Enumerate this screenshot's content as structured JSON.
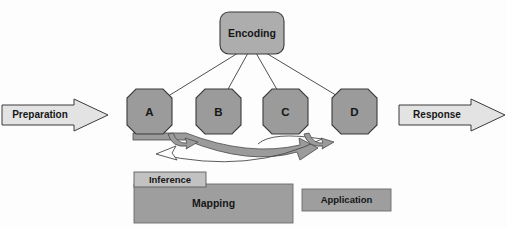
{
  "diagram": {
    "canvas": {
      "width": 507,
      "height": 229,
      "background": "#fdfdfd"
    },
    "colors": {
      "node_fill": "#9b9b9b",
      "node_stroke": "#3b3b3b",
      "encoding_fill": "#adadad",
      "band_fill": "#9e9e9e",
      "band_light_fill": "#c2c2c2",
      "arrow_fill": "#e3e3e3",
      "curve_fill": "#9b9b9b",
      "text": "#161616",
      "line": "#3b3b3b"
    },
    "encoding": {
      "label": "Encoding",
      "shape": "rounded-rectangle",
      "x": 220,
      "y": 12,
      "width": 64,
      "height": 42,
      "radius": 9
    },
    "nodes": [
      {
        "id": "a",
        "label": "A",
        "shape": "octagon",
        "cx": 149.5,
        "cy": 111.5,
        "r": 23
      },
      {
        "id": "b",
        "label": "B",
        "shape": "octagon",
        "cx": 218.5,
        "cy": 111.5,
        "r": 23
      },
      {
        "id": "c",
        "label": "C",
        "shape": "octagon",
        "cx": 285.5,
        "cy": 111.5,
        "r": 23
      },
      {
        "id": "d",
        "label": "D",
        "shape": "octagon",
        "cx": 354.5,
        "cy": 111.5,
        "r": 23
      }
    ],
    "flow_arrows": [
      {
        "id": "preparation",
        "label": "Preparation",
        "direction": "right",
        "x": 2,
        "y": 99,
        "width": 106,
        "height": 32
      },
      {
        "id": "response",
        "label": "Response",
        "direction": "right",
        "x": 399,
        "y": 99,
        "width": 106,
        "height": 32
      }
    ],
    "bands": [
      {
        "id": "inference",
        "label": "Inference",
        "x": 134,
        "y": 172,
        "width": 72,
        "height": 15,
        "fill": "light"
      },
      {
        "id": "mapping",
        "label": "Mapping",
        "x": 134,
        "y": 184,
        "width": 159,
        "height": 39,
        "fill": "dark"
      },
      {
        "id": "application",
        "label": "Application",
        "x": 302,
        "y": 189,
        "width": 89,
        "height": 22,
        "fill": "dark"
      }
    ],
    "connectors": [
      {
        "from": "encoding",
        "to": "a"
      },
      {
        "from": "encoding",
        "to": "b"
      },
      {
        "from": "encoding",
        "to": "c"
      },
      {
        "from": "encoding",
        "to": "d"
      }
    ],
    "curved_arrows": [
      {
        "id": "a-to-b",
        "type": "small-curve",
        "between": [
          "a",
          "b"
        ],
        "direction": "right"
      },
      {
        "id": "c-to-d",
        "type": "small-curve",
        "between": [
          "c",
          "d"
        ],
        "direction": "right"
      },
      {
        "id": "sweep-right",
        "type": "large-sweep",
        "direction": "right"
      },
      {
        "id": "sweep-left",
        "type": "large-sweep",
        "direction": "left"
      }
    ]
  }
}
